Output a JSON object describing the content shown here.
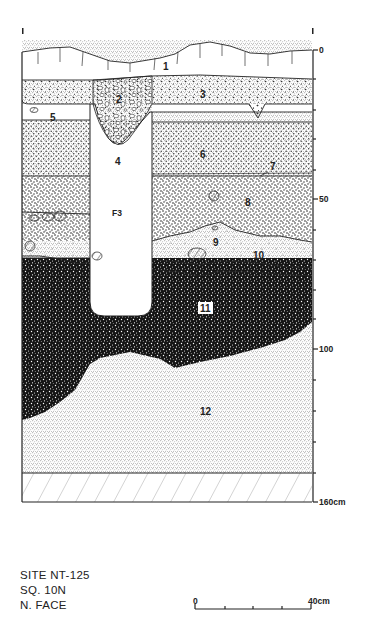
{
  "figure": {
    "type": "stratigraphic-profile",
    "caption": {
      "site": "SITE NT-125",
      "square": "SQ. 10N",
      "face": "N. FACE"
    },
    "depth_axis": {
      "unit": "cm",
      "labels": [
        {
          "value": "0",
          "depth": 0
        },
        {
          "value": "50",
          "depth": 50
        },
        {
          "value": "100",
          "depth": 100
        },
        {
          "value": "160cm",
          "depth": 160
        }
      ],
      "tick_interval_cm": 10,
      "range": [
        0,
        160
      ]
    },
    "scale_bar": {
      "start_label": "0",
      "end_label": "40cm",
      "ticks": 5
    },
    "layers": [
      {
        "id": "1",
        "label": "1",
        "description": "sod / topsoil with root marks"
      },
      {
        "id": "2",
        "label": "2",
        "description": "pebbly fill"
      },
      {
        "id": "3",
        "label": "3",
        "description": "coarse stippled sand"
      },
      {
        "id": "4",
        "label": "4",
        "description": "light fill of feature"
      },
      {
        "id": "5",
        "label": "5",
        "description": "light band"
      },
      {
        "id": "6",
        "label": "6",
        "description": "dotted sand"
      },
      {
        "id": "7",
        "label": "7",
        "description": "thin line"
      },
      {
        "id": "8",
        "label": "8",
        "description": "speckled layer with stones"
      },
      {
        "id": "9",
        "label": "9",
        "description": "light lens"
      },
      {
        "id": "10",
        "label": "10",
        "description": "thin band"
      },
      {
        "id": "11",
        "label": "11",
        "description": "dark organic layer"
      },
      {
        "id": "12",
        "label": "12",
        "description": "fine stippled sand"
      }
    ],
    "features": [
      {
        "id": "F3",
        "label": "F3",
        "description": "pit feature"
      }
    ]
  }
}
